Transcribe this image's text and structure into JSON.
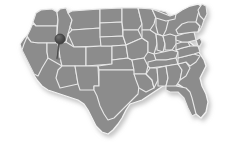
{
  "figure": {
    "kind": "choropleth-style-locator-map",
    "region": "united-states-contiguous",
    "title_text": "",
    "caption_text": "",
    "legend_text": "",
    "background_color": "#ffffff"
  },
  "map": {
    "name": "united-states-map",
    "land_fill_color": "#8c8c8c",
    "state_border_color": "#e8e8e8",
    "outer_border_color": "#f2f2f2",
    "shadow_color": "#cfcfcf",
    "state_border_width": 1.1,
    "outline_width": 1.3,
    "has_state_borders": true,
    "has_drop_shadow": true,
    "labels_visible": false
  },
  "marker": {
    "name": "location-pin",
    "type": "push-pin",
    "head_color": "#4a4a4a",
    "head_highlight_color": "#6e6e6e",
    "needle_color": "#575757",
    "head_center_x": 60.0,
    "head_center_y": 39.0,
    "head_radius": 5.0,
    "tip_x": 56.5,
    "tip_y": 58.5,
    "label_text": "",
    "tooltip_text": ""
  },
  "chart_data": {
    "type": "map",
    "title": "",
    "xlabel": "",
    "ylabel": "",
    "projection": "albers-usa-approximate",
    "value_field": null,
    "regions_shaded_uniformly": true,
    "uniform_region_value_color": "#8c8c8c",
    "markers": [
      {
        "label": "",
        "pixel_x": 60,
        "pixel_y": 39,
        "approx_state": "Utah / Idaho border area",
        "marker_style": "push-pin",
        "color": "#4a4a4a"
      }
    ],
    "legend": {
      "visible": false,
      "position": "none",
      "entries": []
    },
    "annotations": [],
    "axis": {
      "visible": false,
      "grid": false
    }
  }
}
